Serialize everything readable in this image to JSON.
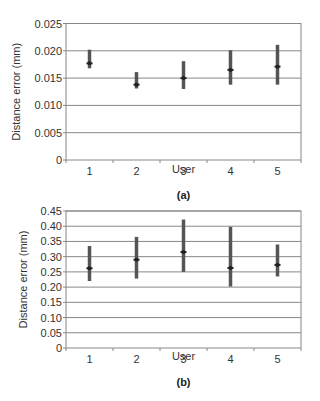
{
  "chart_data": [
    {
      "type": "errorbar",
      "panel_label": "(a)",
      "title": "",
      "xlabel": "User",
      "ylabel": "Distance error (mm)",
      "categories": [
        "1",
        "2",
        "3",
        "4",
        "5"
      ],
      "yticks": [
        "0",
        "0.005",
        "0.010",
        "0.015",
        "0.020",
        "0.025"
      ],
      "ylim": [
        0,
        0.025
      ],
      "grid": true,
      "legend": null,
      "series": [
        {
          "name": "Distance error",
          "values": [
            0.0177,
            0.0138,
            0.015,
            0.0165,
            0.0171
          ],
          "lower": [
            0.0168,
            0.0131,
            0.013,
            0.0138,
            0.0138
          ],
          "upper": [
            0.0202,
            0.0161,
            0.0181,
            0.0201,
            0.0211
          ]
        }
      ]
    },
    {
      "type": "errorbar",
      "panel_label": "(b)",
      "title": "",
      "xlabel": "User",
      "ylabel": "Distance error (mm)",
      "categories": [
        "1",
        "2",
        "3",
        "4",
        "5"
      ],
      "yticks": [
        "0",
        "0.05",
        "0.10",
        "0.15",
        "0.20",
        "0.25",
        "0.30",
        "0.35",
        "0.40",
        "0.45"
      ],
      "ylim": [
        0,
        0.45
      ],
      "grid": true,
      "legend": null,
      "series": [
        {
          "name": "Distance error",
          "values": [
            0.262,
            0.29,
            0.315,
            0.263,
            0.273
          ],
          "lower": [
            0.22,
            0.228,
            0.25,
            0.202,
            0.235
          ],
          "upper": [
            0.335,
            0.365,
            0.422,
            0.398,
            0.34
          ]
        }
      ]
    }
  ],
  "colors": {
    "axis": "#888888",
    "grid": "#888888",
    "bar": "#555555",
    "marker": "#222222"
  }
}
